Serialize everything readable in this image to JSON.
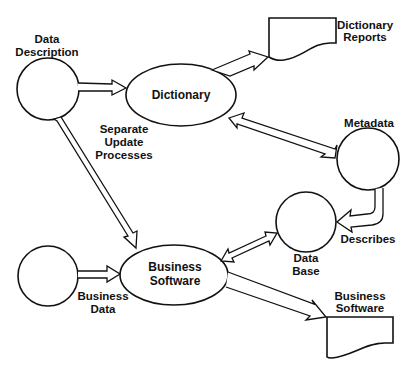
{
  "diagram": {
    "type": "data-flow",
    "nodes": {
      "data_description": {
        "kind": "circle",
        "label_lines": [
          "Data",
          "Description"
        ]
      },
      "dictionary": {
        "kind": "ellipse",
        "label_lines": [
          "Dictionary"
        ]
      },
      "dictionary_reports": {
        "kind": "document",
        "label_lines": [
          "Dictionary",
          "Reports"
        ]
      },
      "metadata": {
        "kind": "circle",
        "label_lines": [
          "Metadata"
        ]
      },
      "data_base": {
        "kind": "circle",
        "label_lines": [
          "Data",
          "Base"
        ]
      },
      "business_data": {
        "kind": "circle",
        "label_lines": [
          "Business",
          "Data"
        ]
      },
      "business_software": {
        "kind": "ellipse",
        "label_lines": [
          "Business",
          "Software"
        ]
      },
      "business_software_output": {
        "kind": "document",
        "label_lines": [
          "Business",
          "Software"
        ]
      }
    },
    "annotations": {
      "separate_update_processes": [
        "Separate",
        "Update",
        "Processes"
      ],
      "describes": [
        "Describes"
      ]
    },
    "edges": [
      {
        "from": "data_description",
        "to": "dictionary",
        "direction": "forward"
      },
      {
        "from": "data_description",
        "to": "business_software",
        "direction": "forward"
      },
      {
        "from": "dictionary",
        "to": "dictionary_reports",
        "direction": "forward"
      },
      {
        "from": "dictionary",
        "to": "metadata",
        "direction": "both"
      },
      {
        "from": "metadata",
        "to": "data_base",
        "direction": "forward",
        "label": "Describes"
      },
      {
        "from": "business_data",
        "to": "business_software",
        "direction": "forward"
      },
      {
        "from": "business_software",
        "to": "data_base",
        "direction": "both"
      },
      {
        "from": "business_software",
        "to": "business_software_output",
        "direction": "forward"
      }
    ]
  }
}
